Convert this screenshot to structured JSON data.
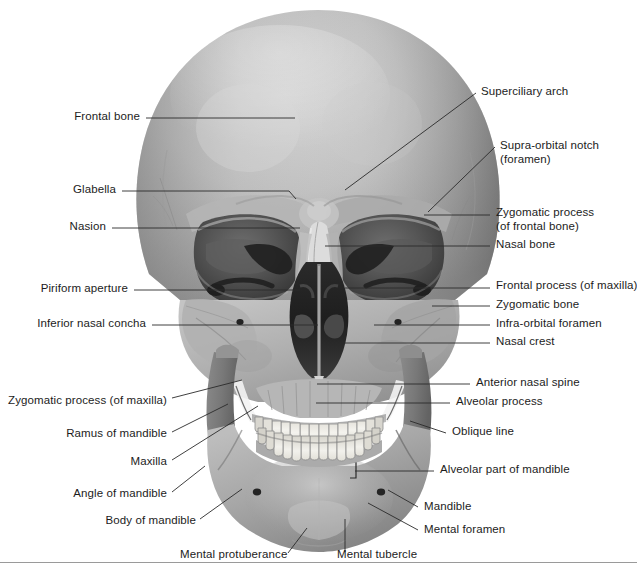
{
  "figure": {
    "view": "anterior (frontal) aspect",
    "style": "grayscale airbrush anatomical illustration with leader-line labels"
  },
  "colors": {
    "background": "#ffffff",
    "bone_light": "#cfcfcf",
    "bone_mid": "#a8a8a8",
    "bone_shadow": "#7d7d7d",
    "bone_deep_shadow": "#5a5a5a",
    "cavity_dark": "#2e2e2e",
    "cavity_black": "#1a1a1a",
    "tooth": "#f0efe9",
    "leader_line": "#2a2a2a",
    "label_text": "#1c1c1c",
    "rule": "#9a9a9a"
  },
  "labels": {
    "left": [
      {
        "id": "frontal-bone",
        "text": "Frontal bone",
        "text_x": 140,
        "text_y": 121,
        "leader": [
          [
            146,
            118
          ],
          [
            295,
            118
          ]
        ]
      },
      {
        "id": "glabella",
        "text": "Glabella",
        "text_x": 116,
        "text_y": 194,
        "leader": [
          [
            122,
            191
          ],
          [
            289,
            191
          ],
          [
            296,
            199
          ]
        ]
      },
      {
        "id": "nasion",
        "text": "Nasion",
        "text_x": 106,
        "text_y": 231,
        "leader": [
          [
            112,
            228
          ],
          [
            300,
            228
          ]
        ]
      },
      {
        "id": "piriform-aperture",
        "text": "Piriform aperture",
        "text_x": 128,
        "text_y": 293,
        "leader": [
          [
            134,
            290
          ],
          [
            300,
            290
          ]
        ]
      },
      {
        "id": "inferior-nasal-concha",
        "text": "Inferior nasal concha",
        "text_x": 146,
        "text_y": 328,
        "leader": [
          [
            152,
            325
          ],
          [
            318,
            325
          ]
        ]
      },
      {
        "id": "zygomatic-process-maxilla",
        "text": "Zygomatic process (of maxilla)",
        "text_x": 167,
        "text_y": 405,
        "leader": [
          [
            172,
            398
          ],
          [
            242,
            380
          ]
        ]
      },
      {
        "id": "ramus-of-mandible",
        "text": "Ramus of mandible",
        "text_x": 167,
        "text_y": 438,
        "leader": [
          [
            172,
            432
          ],
          [
            228,
            404
          ]
        ]
      },
      {
        "id": "maxilla",
        "text": "Maxilla",
        "text_x": 167,
        "text_y": 466,
        "leader": [
          [
            172,
            460
          ],
          [
            258,
            406
          ]
        ]
      },
      {
        "id": "angle-of-mandible",
        "text": "Angle of mandible",
        "text_x": 167,
        "text_y": 498,
        "leader": [
          [
            172,
            492
          ],
          [
            205,
            466
          ]
        ]
      },
      {
        "id": "body-of-mandible",
        "text": "Body of mandible",
        "text_x": 196,
        "text_y": 525,
        "leader": [
          [
            200,
            519
          ],
          [
            242,
            489
          ]
        ]
      }
    ],
    "right": [
      {
        "id": "superciliary-arch",
        "text": "Superciliary arch",
        "text_x": 481,
        "text_y": 96,
        "leader": [
          [
            476,
            93
          ],
          [
            345,
            190
          ]
        ]
      },
      {
        "id": "supra-orbital-notch",
        "text": "Supra-orbital notch\n(foramen)",
        "text_x": 500,
        "text_y": 150,
        "leader": [
          [
            495,
            147
          ],
          [
            428,
            212
          ]
        ]
      },
      {
        "id": "zygomatic-process-frontal",
        "text": "Zygomatic process\n(of frontal bone)",
        "text_x": 496,
        "text_y": 217,
        "leader": [
          [
            490,
            215
          ],
          [
            424,
            215
          ]
        ]
      },
      {
        "id": "nasal-bone",
        "text": "Nasal bone",
        "text_x": 496,
        "text_y": 249,
        "leader": [
          [
            490,
            246
          ],
          [
            325,
            246
          ]
        ]
      },
      {
        "id": "frontal-process-maxilla",
        "text": "Frontal process (of maxilla)",
        "text_x": 496,
        "text_y": 290,
        "leader": [
          [
            490,
            288
          ],
          [
            345,
            288
          ]
        ]
      },
      {
        "id": "zygomatic-bone",
        "text": "Zygomatic bone",
        "text_x": 496,
        "text_y": 309,
        "leader": [
          [
            490,
            306
          ],
          [
            432,
            306
          ]
        ]
      },
      {
        "id": "infra-orbital-foramen",
        "text": "Infra-orbital foramen",
        "text_x": 496,
        "text_y": 328,
        "leader": [
          [
            490,
            325
          ],
          [
            374,
            325
          ]
        ]
      },
      {
        "id": "nasal-crest",
        "text": "Nasal crest",
        "text_x": 496,
        "text_y": 346,
        "leader": [
          [
            490,
            343
          ],
          [
            340,
            343
          ]
        ]
      },
      {
        "id": "anterior-nasal-spine",
        "text": "Anterior nasal spine",
        "text_x": 476,
        "text_y": 387,
        "leader": [
          [
            470,
            384
          ],
          [
            317,
            384
          ]
        ]
      },
      {
        "id": "alveolar-process",
        "text": "Alveolar process",
        "text_x": 456,
        "text_y": 406,
        "leader": [
          [
            450,
            403
          ],
          [
            316,
            403
          ]
        ]
      },
      {
        "id": "oblique-line",
        "text": "Oblique line",
        "text_x": 452,
        "text_y": 436,
        "leader": [
          [
            446,
            433
          ],
          [
            410,
            421
          ]
        ]
      },
      {
        "id": "alveolar-part-of-mandible",
        "text": "Alveolar part of mandible",
        "text_x": 440,
        "text_y": 474,
        "leader": [
          [
            434,
            471
          ],
          [
            355,
            471
          ]
        ]
      },
      {
        "id": "mandible",
        "text": "Mandible",
        "text_x": 424,
        "text_y": 511,
        "leader": [
          [
            418,
            507
          ],
          [
            388,
            490
          ]
        ]
      },
      {
        "id": "mental-foramen",
        "text": "Mental foramen",
        "text_x": 424,
        "text_y": 534,
        "leader": [
          [
            418,
            530
          ],
          [
            368,
            503
          ]
        ]
      }
    ],
    "bottom": [
      {
        "id": "mental-protuberance",
        "text": "Mental protuberance",
        "text_x": 180,
        "text_y": 559,
        "leader": [
          [
            288,
            553
          ],
          [
            307,
            528
          ]
        ]
      },
      {
        "id": "mental-tubercle",
        "text": "Mental tubercle",
        "text_x": 337,
        "text_y": 559,
        "leader": [
          [
            345,
            552
          ],
          [
            345,
            519
          ]
        ]
      }
    ]
  },
  "structures": [
    "frontal bone",
    "glabella",
    "nasion",
    "superciliary arch",
    "supra-orbital notch (foramen)",
    "zygomatic process (of frontal bone)",
    "nasal bone",
    "frontal process (of maxilla)",
    "zygomatic bone",
    "infra-orbital foramen",
    "nasal crest",
    "piriform aperture",
    "inferior nasal concha",
    "anterior nasal spine",
    "alveolar process",
    "zygomatic process (of maxilla)",
    "oblique line",
    "ramus of mandible",
    "maxilla",
    "angle of mandible",
    "body of mandible",
    "alveolar part of mandible",
    "mandible",
    "mental foramen",
    "mental protuberance",
    "mental tubercle"
  ]
}
